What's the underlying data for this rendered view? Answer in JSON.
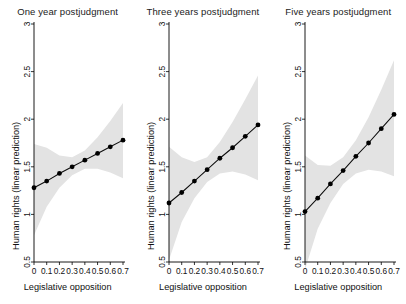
{
  "chart_data": {
    "type": "line",
    "title": "",
    "xlabel": "Legislative opposition",
    "ylabel": "Human rights (linear prediction)",
    "xlim": [
      0,
      0.7
    ],
    "ylim": [
      0.5,
      3
    ],
    "xticks": [
      0,
      0.1,
      0.2,
      0.3,
      0.4,
      0.5,
      0.6,
      0.7
    ],
    "xticklabels": [
      "0",
      "0.1",
      "0.2",
      "0.3",
      "0.4",
      "0.5",
      "0.6",
      "0.7"
    ],
    "yticks": [
      0.5,
      1,
      1.5,
      2,
      2.5,
      3
    ],
    "yticklabels": [
      "0.5",
      "1",
      "1.5",
      "2",
      "2.5",
      "3"
    ],
    "grid": false,
    "legend": "none",
    "band_color": "#e3e3e3",
    "line_color": "#0d0d0d",
    "marker_color": "#000000",
    "panels": [
      {
        "title": "One year postjudgment",
        "x": [
          0,
          0.1,
          0.2,
          0.3,
          0.4,
          0.5,
          0.6,
          0.7
        ],
        "values": [
          1.28,
          1.35,
          1.43,
          1.5,
          1.57,
          1.64,
          1.71,
          1.78
        ],
        "ci_lower": [
          0.78,
          1.08,
          1.28,
          1.41,
          1.48,
          1.48,
          1.44,
          1.38
        ],
        "ci_upper": [
          1.74,
          1.7,
          1.62,
          1.6,
          1.67,
          1.81,
          1.98,
          2.17
        ]
      },
      {
        "title": "Three years postjudgment",
        "x": [
          0,
          0.1,
          0.2,
          0.3,
          0.4,
          0.5,
          0.6,
          0.7
        ],
        "values": [
          1.12,
          1.23,
          1.35,
          1.47,
          1.59,
          1.7,
          1.82,
          1.94
        ],
        "ci_lower": [
          0.52,
          0.92,
          1.17,
          1.34,
          1.43,
          1.45,
          1.42,
          1.36
        ],
        "ci_upper": [
          1.71,
          1.6,
          1.55,
          1.6,
          1.76,
          1.97,
          2.21,
          2.46
        ]
      },
      {
        "title": "Five years postjudgment",
        "x": [
          0,
          0.1,
          0.2,
          0.3,
          0.4,
          0.5,
          0.6,
          0.7
        ],
        "values": [
          1.03,
          1.17,
          1.32,
          1.46,
          1.61,
          1.75,
          1.9,
          2.05
        ],
        "ci_lower": [
          0.42,
          0.85,
          1.12,
          1.32,
          1.43,
          1.47,
          1.45,
          1.4
        ],
        "ci_upper": [
          1.62,
          1.52,
          1.51,
          1.6,
          1.78,
          2.02,
          2.31,
          2.62
        ]
      }
    ]
  }
}
